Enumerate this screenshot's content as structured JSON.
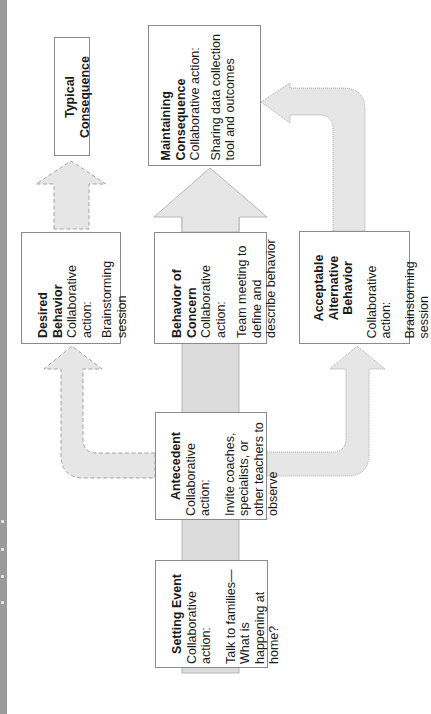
{
  "diagram": {
    "orientation": "rotated-90-ccw",
    "nodes": {
      "typical_consequence": {
        "title": "Typical Consequence"
      },
      "maintaining_consequence": {
        "title": "Maintaining Consequence",
        "subtitle": "Collaborative action:",
        "body": "Sharing data collection tool and outcomes"
      },
      "desired_behavior": {
        "title": "Desired Behavior",
        "subtitle": "Collaborative action:",
        "body": "Brainstorming session"
      },
      "behavior_of_concern": {
        "title": "Behavior of Concern",
        "subtitle": "Collaborative action:",
        "body": "Team meeting to define and describe behavior"
      },
      "acceptable_alternative_behavior": {
        "title_line1": "Acceptable",
        "title_line2": "Alternative Behavior",
        "subtitle": "Collaborative action:",
        "body": "Brainstorming session"
      },
      "antecedent": {
        "title": "Antecedent",
        "subtitle": "Collaborative action:",
        "body": "Invite coaches, specialists, or other teachers to observe"
      },
      "setting_event": {
        "title": "Setting Event",
        "subtitle": "Collaborative action:",
        "body": "Talk to families—What is happening at home?"
      }
    },
    "edges": [
      {
        "from": "setting_event",
        "to": "antecedent",
        "style": "solid"
      },
      {
        "from": "antecedent",
        "to": "behavior_of_concern",
        "style": "solid"
      },
      {
        "from": "behavior_of_concern",
        "to": "maintaining_consequence",
        "style": "solid"
      },
      {
        "from": "antecedent",
        "to": "desired_behavior",
        "style": "dashed"
      },
      {
        "from": "desired_behavior",
        "to": "typical_consequence",
        "style": "dashed"
      },
      {
        "from": "antecedent",
        "to": "acceptable_alternative_behavior",
        "style": "dotted"
      },
      {
        "from": "acceptable_alternative_behavior",
        "to": "maintaining_consequence",
        "style": "dotted"
      }
    ]
  },
  "colors": {
    "arrow_fill": "#e6e6e6",
    "arrow_fill_dark": "#dcdcdc",
    "arrow_stroke": "#9a9a9a",
    "box_border": "#8a8a8a",
    "edge_strip": "#9b9b9b"
  }
}
